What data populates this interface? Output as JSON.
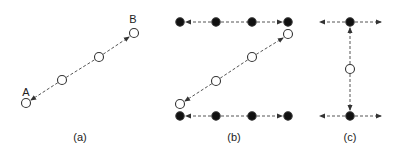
{
  "colors": {
    "stroke": "#333333",
    "filled": "#111111",
    "open_fill": "#ffffff",
    "line": "#555555"
  },
  "panels": [
    {
      "id": "a",
      "caption": "(a)",
      "caption_pos": [
        80,
        131
      ],
      "point_labels": [
        {
          "text": "A",
          "x": 26,
          "y": 86
        },
        {
          "text": "B",
          "x": 133,
          "y": 13
        }
      ],
      "nodes": [
        {
          "x": 26,
          "y": 103,
          "type": "open"
        },
        {
          "x": 62,
          "y": 80,
          "type": "open"
        },
        {
          "x": 99,
          "y": 57,
          "type": "open"
        },
        {
          "x": 134,
          "y": 33,
          "type": "open"
        }
      ],
      "arrows": [
        {
          "from": [
            62,
            80
          ],
          "to": [
            31,
            100
          ],
          "head": "end"
        },
        {
          "from": [
            99,
            57
          ],
          "to": [
            129,
            37
          ],
          "head": "end"
        },
        {
          "from": [
            62,
            80
          ],
          "to": [
            99,
            57
          ],
          "head": "none"
        }
      ]
    },
    {
      "id": "b",
      "caption": "(b)",
      "caption_pos": [
        234,
        131
      ],
      "point_labels": [],
      "nodes": [
        {
          "x": 180,
          "y": 22,
          "type": "filled"
        },
        {
          "x": 216,
          "y": 22,
          "type": "filled"
        },
        {
          "x": 252,
          "y": 22,
          "type": "filled"
        },
        {
          "x": 288,
          "y": 22,
          "type": "filled"
        },
        {
          "x": 288,
          "y": 34,
          "type": "open"
        },
        {
          "x": 252,
          "y": 57,
          "type": "open"
        },
        {
          "x": 216,
          "y": 81,
          "type": "open"
        },
        {
          "x": 180,
          "y": 104,
          "type": "open"
        },
        {
          "x": 180,
          "y": 116,
          "type": "filled"
        },
        {
          "x": 216,
          "y": 116,
          "type": "filled"
        },
        {
          "x": 252,
          "y": 116,
          "type": "filled"
        },
        {
          "x": 288,
          "y": 116,
          "type": "filled"
        }
      ],
      "arrows": [
        {
          "from": [
            216,
            22
          ],
          "to": [
            186,
            22
          ],
          "head": "end"
        },
        {
          "from": [
            216,
            22
          ],
          "to": [
            252,
            22
          ],
          "head": "none"
        },
        {
          "from": [
            252,
            22
          ],
          "to": [
            282,
            22
          ],
          "head": "end"
        },
        {
          "from": [
            252,
            57
          ],
          "to": [
            283,
            38
          ],
          "head": "end"
        },
        {
          "from": [
            216,
            81
          ],
          "to": [
            252,
            57
          ],
          "head": "none"
        },
        {
          "from": [
            216,
            81
          ],
          "to": [
            185,
            101
          ],
          "head": "end"
        },
        {
          "from": [
            216,
            116
          ],
          "to": [
            186,
            116
          ],
          "head": "end"
        },
        {
          "from": [
            216,
            116
          ],
          "to": [
            252,
            116
          ],
          "head": "none"
        },
        {
          "from": [
            252,
            116
          ],
          "to": [
            282,
            116
          ],
          "head": "end"
        }
      ]
    },
    {
      "id": "c",
      "caption": "(c)",
      "caption_pos": [
        350,
        131
      ],
      "point_labels": [],
      "nodes": [
        {
          "x": 350,
          "y": 22,
          "type": "filled"
        },
        {
          "x": 350,
          "y": 69,
          "type": "open"
        },
        {
          "x": 350,
          "y": 116,
          "type": "filled"
        }
      ],
      "arrows": [
        {
          "from": [
            345,
            22
          ],
          "to": [
            320,
            22
          ],
          "head": "end"
        },
        {
          "from": [
            355,
            22
          ],
          "to": [
            381,
            22
          ],
          "head": "end"
        },
        {
          "from": [
            350,
            64
          ],
          "to": [
            350,
            28
          ],
          "head": "end"
        },
        {
          "from": [
            350,
            74
          ],
          "to": [
            350,
            110
          ],
          "head": "end"
        },
        {
          "from": [
            345,
            116
          ],
          "to": [
            320,
            116
          ],
          "head": "end"
        },
        {
          "from": [
            355,
            116
          ],
          "to": [
            381,
            116
          ],
          "head": "end"
        }
      ]
    }
  ]
}
